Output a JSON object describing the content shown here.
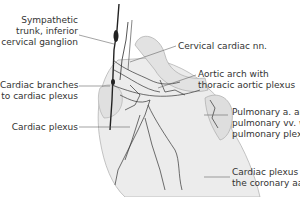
{
  "figure": {
    "labels": {
      "sympathetic_trunk": "Sympathetic\ntrunk, inferior\ncervical ganglion",
      "cardiac_branches": "Cardiac branches\nto cardiac plexus",
      "cardiac_plexus": "Cardiac plexus",
      "cervical_cardiac_nn": "Cervical cardiac nn.",
      "aortic_arch": "Aortic arch with\nthoracic aortic plexus",
      "pulmonary": "Pulmonary a. and\npulmonary vv. with\npulmonary plexus",
      "cardiac_plexus_coronary": "Cardiac plexus (along\nthe coronary aa.)"
    }
  },
  "colors": {
    "text": "#333333",
    "leader": "#555555",
    "heart_fill": "#e9e9e9",
    "heart_stroke": "#aaaaaa",
    "nerve": "#222222"
  }
}
